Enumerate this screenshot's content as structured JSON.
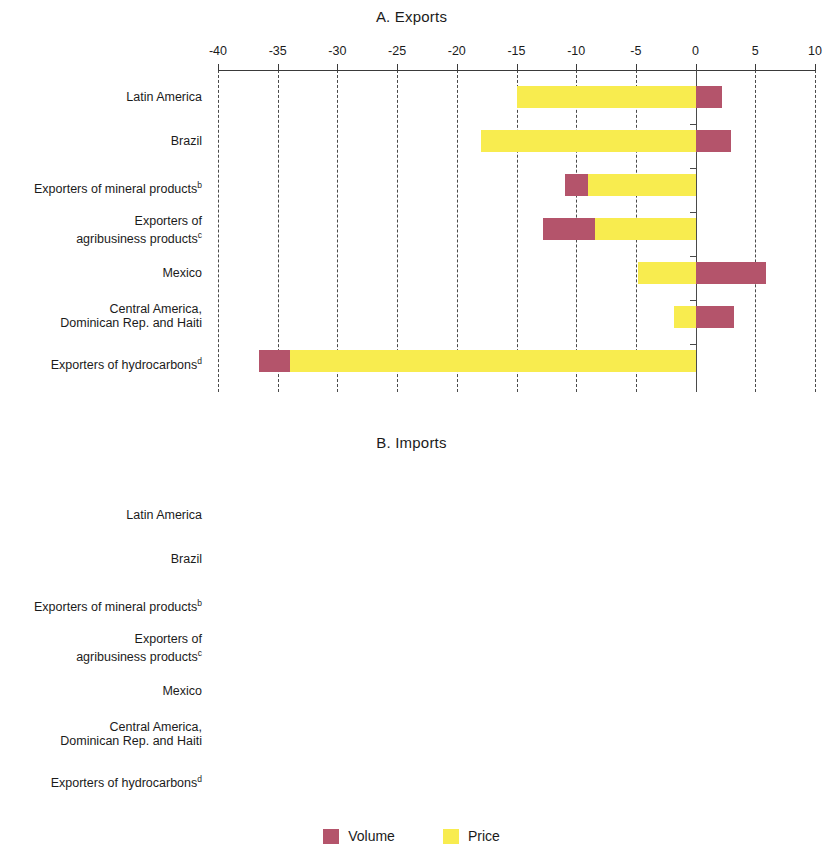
{
  "legend": {
    "volume_label": "Volume",
    "price_label": "Price",
    "volume_color": "#b4546b",
    "price_color": "#f8ec4f"
  },
  "panels": [
    {
      "id": "A",
      "title": "A. Exports",
      "axis": {
        "min": -40,
        "max": 10,
        "ticks": [
          -40,
          -35,
          -30,
          -25,
          -20,
          -15,
          -10,
          -5,
          0,
          5,
          10
        ]
      }
    },
    {
      "id": "B",
      "title": "B. Imports",
      "axis": {
        "min": -30,
        "max": 10,
        "ticks": [
          -30,
          -25,
          -20,
          -15,
          -10,
          -5,
          0,
          5,
          10
        ]
      }
    }
  ],
  "categories": [
    {
      "label": "Latin America",
      "sup": ""
    },
    {
      "label": "Brazil",
      "sup": ""
    },
    {
      "label": "Exporters of mineral products",
      "sup": "b"
    },
    {
      "label": "Exporters of\nagribusiness products",
      "sup": "c"
    },
    {
      "label": "Mexico",
      "sup": ""
    },
    {
      "label": "Central America,\nDominican Rep. and Haiti",
      "sup": ""
    },
    {
      "label": "Exporters of hydrocarbons",
      "sup": "d"
    }
  ],
  "chart_data": [
    {
      "type": "bar",
      "title": "A. Exports",
      "orientation": "horizontal",
      "stacked": true,
      "xlabel": "",
      "ylabel": "",
      "xlim": [
        -40,
        10
      ],
      "xticks": [
        -40,
        -35,
        -30,
        -25,
        -20,
        -15,
        -10,
        -5,
        0,
        5,
        10
      ],
      "grid": true,
      "legend_position": "bottom",
      "categories": [
        "Latin America",
        "Brazil",
        "Exporters of mineral products",
        "Exporters of agribusiness products",
        "Mexico",
        "Central America, Dominican Rep. and Haiti",
        "Exporters of hydrocarbons"
      ],
      "series": [
        {
          "name": "Volume",
          "values": [
            2.2,
            3.0,
            -1.9,
            -4.4,
            5.9,
            3.2,
            -2.6
          ]
        },
        {
          "name": "Price",
          "values": [
            -15.0,
            -18.0,
            -9.0,
            -8.4,
            -4.8,
            -1.8,
            -34.0
          ]
        }
      ]
    },
    {
      "type": "bar",
      "title": "B. Imports",
      "orientation": "horizontal",
      "stacked": true,
      "xlabel": "",
      "ylabel": "",
      "xlim": [
        -30,
        10
      ],
      "xticks": [
        -30,
        -25,
        -20,
        -15,
        -10,
        -5,
        0,
        5,
        10
      ],
      "grid": true,
      "legend_position": "bottom",
      "categories": [
        "Latin America",
        "Brazil",
        "Exporters of mineral products",
        "Exporters of agribusiness products",
        "Mexico",
        "Central America, Dominican Rep. and Haiti",
        "Exporters of hydrocarbons"
      ],
      "series": [
        {
          "name": "Volume",
          "values": [
            -3.8,
            -16.2,
            -2.0,
            -3.7,
            3.8,
            5.9,
            -14.4
          ]
        },
        {
          "name": "Price",
          "values": [
            -6.5,
            -9.1,
            -10.3,
            -7.8,
            -3.8,
            -13.3,
            -7.5
          ]
        }
      ]
    }
  ]
}
